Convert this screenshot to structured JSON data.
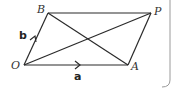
{
  "diagram": {
    "type": "parallelogram-vectors",
    "points": {
      "O": {
        "label": "O",
        "x": 24,
        "y": 65
      },
      "A": {
        "label": "A",
        "x": 128,
        "y": 65
      },
      "B": {
        "label": "B",
        "x": 48,
        "y": 13
      },
      "P": {
        "label": "P",
        "x": 151,
        "y": 13
      }
    },
    "edges": [
      {
        "from": "O",
        "to": "A"
      },
      {
        "from": "O",
        "to": "B"
      },
      {
        "from": "B",
        "to": "P"
      },
      {
        "from": "A",
        "to": "P"
      },
      {
        "from": "O",
        "to": "P"
      },
      {
        "from": "B",
        "to": "A"
      }
    ],
    "vectors": {
      "a": {
        "label": "a",
        "on_edge": "OA"
      },
      "b": {
        "label": "b",
        "on_edge": "OB"
      }
    },
    "colors": {
      "line": "#2a2a2a",
      "frame": "#9a9a9a",
      "background": "#ffffff"
    }
  }
}
